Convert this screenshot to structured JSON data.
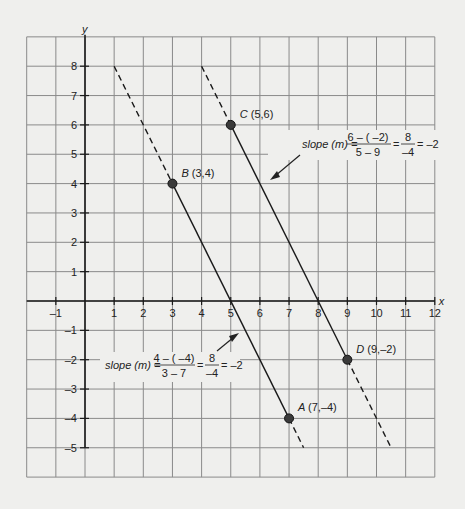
{
  "chart_data": {
    "type": "line",
    "title": "",
    "xlabel": "x",
    "ylabel": "y",
    "xlim": [
      -2,
      12
    ],
    "ylim": [
      -6,
      9
    ],
    "grid": true,
    "x_ticks": [
      "-1",
      "1",
      "2",
      "3",
      "4",
      "5",
      "6",
      "7",
      "8",
      "9",
      "10",
      "11",
      "12"
    ],
    "y_ticks": [
      "8",
      "7",
      "6",
      "5",
      "4",
      "3",
      "2",
      "1",
      "-1",
      "-2",
      "-3",
      "-4",
      "-5"
    ],
    "points": [
      {
        "name": "A",
        "label": "A",
        "coords": "(7,–4)",
        "x": 7,
        "y": -4
      },
      {
        "name": "B",
        "label": "B",
        "coords": "(3,4)",
        "x": 3,
        "y": 4
      },
      {
        "name": "C",
        "label": "C",
        "coords": "(5,6)",
        "x": 5,
        "y": 6
      },
      {
        "name": "D",
        "label": "D",
        "coords": "(9,–2)",
        "x": 9,
        "y": -2
      }
    ],
    "series": [
      {
        "name": "Line AB",
        "slope": -2,
        "solid": [
          [
            3,
            4
          ],
          [
            7,
            -4
          ]
        ],
        "dashed": [
          [
            1,
            8
          ],
          [
            3,
            4
          ],
          [
            7,
            -4
          ],
          [
            7.5,
            -5
          ]
        ]
      },
      {
        "name": "Line CD",
        "slope": -2,
        "solid": [
          [
            5,
            6
          ],
          [
            9,
            -2
          ]
        ],
        "dashed": [
          [
            4,
            8
          ],
          [
            5,
            6
          ],
          [
            9,
            -2
          ],
          [
            10.5,
            -5
          ]
        ]
      }
    ],
    "annotations": [
      {
        "id": "slope_cd",
        "prefix": "slope (m) =",
        "num1": "6 – ( –2)",
        "den1": "5 – 9",
        "num2": "8",
        "den2": "–4",
        "result": "= –2"
      },
      {
        "id": "slope_ab",
        "prefix": "slope (m) =",
        "num1": "4 – ( –4)",
        "den1": "3 – 7",
        "num2": "8",
        "den2": "–4",
        "result": "= –2"
      }
    ]
  }
}
